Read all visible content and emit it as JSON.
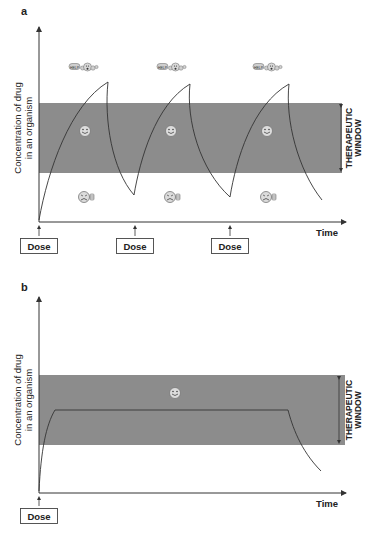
{
  "panels": [
    {
      "id": "a",
      "label": "a",
      "y_axis_label_line1": "Concentration of drug",
      "y_axis_label_line2": "in an organism",
      "x_axis_label": "Time",
      "window_label_line1": "THERAPEUTIC",
      "window_label_line2": "WINDOW",
      "doses": [
        {
          "label": "Dose"
        },
        {
          "label": "Dose"
        },
        {
          "label": "Dose"
        }
      ],
      "icons": {
        "above_window": "toxic-help-icon",
        "in_window": "happy-face-icon",
        "below_window": "sad-face-thumbs-down-icon"
      },
      "help_text": "HELP"
    },
    {
      "id": "b",
      "label": "b",
      "y_axis_label_line1": "Concentration of drug",
      "y_axis_label_line2": "in an organism",
      "x_axis_label": "Time",
      "window_label_line1": "THERAPEUTIC",
      "window_label_line2": "WINDOW",
      "doses": [
        {
          "label": "Dose"
        }
      ],
      "icons": {
        "in_window": "happy-face-icon"
      }
    }
  ],
  "colors": {
    "window_band": "#8c8c8c",
    "curve": "#333333",
    "axis": "#333333",
    "icon_face": "#d9d9d9"
  }
}
